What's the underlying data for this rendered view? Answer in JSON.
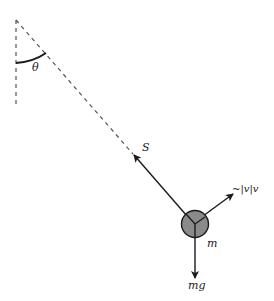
{
  "diagram": {
    "type": "pendulum-free-body",
    "labels": {
      "angle": "θ",
      "tension": "S",
      "drag": "~|v|v",
      "mass": "m",
      "weight": "mg"
    },
    "colors": {
      "line": "#1a1a1a",
      "dashed": "#555555",
      "bob_fill": "#8a8a8a"
    }
  }
}
